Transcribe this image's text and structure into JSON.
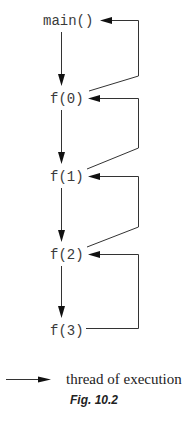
{
  "figure": {
    "type": "recursion-call-diagram",
    "nodes": [
      {
        "id": "main",
        "label": "main()"
      },
      {
        "id": "f0",
        "label": "f(0)"
      },
      {
        "id": "f1",
        "label": "f(1)"
      },
      {
        "id": "f2",
        "label": "f(2)"
      },
      {
        "id": "f3",
        "label": "f(3)"
      }
    ],
    "calls": [
      {
        "from": "main",
        "to": "f0"
      },
      {
        "from": "f0",
        "to": "f1"
      },
      {
        "from": "f1",
        "to": "f2"
      },
      {
        "from": "f2",
        "to": "f3"
      }
    ],
    "returns": [
      {
        "from": "f3",
        "to": "f2"
      },
      {
        "from": "f2",
        "to": "f1"
      },
      {
        "from": "f1",
        "to": "f0"
      },
      {
        "from": "f0",
        "to": "main"
      }
    ],
    "legend": {
      "label": "thread of execution"
    },
    "caption": "Fig. 10.2",
    "colors": {
      "line": "#333333",
      "text": "#3a3a3a"
    }
  }
}
